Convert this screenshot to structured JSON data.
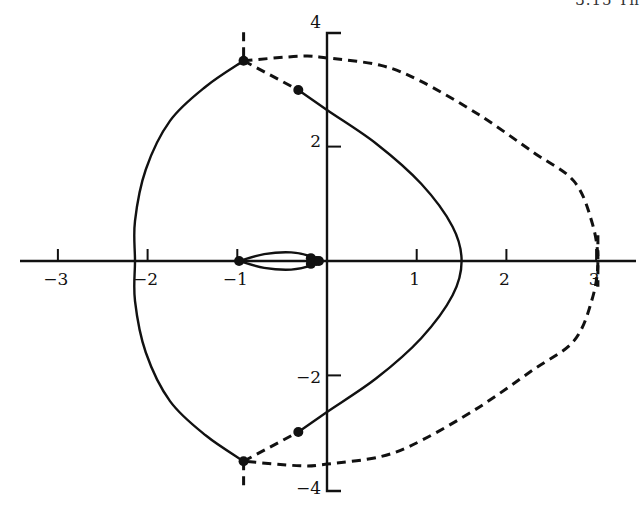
{
  "page": {
    "header_fragment": "3.15  Th"
  },
  "chart_data": {
    "type": "line",
    "title": "",
    "xlabel": "",
    "ylabel": "",
    "xlim": [
      -3.3,
      3.4
    ],
    "ylim": [
      -4,
      4
    ],
    "grid": false,
    "legend": null,
    "x_ticks": [
      -3,
      -2,
      -1,
      1,
      2,
      3
    ],
    "x_tick_labels": [
      "−3",
      "−2",
      "−1",
      "1",
      "2",
      "3"
    ],
    "y_ticks": [
      4,
      2,
      -2,
      -4
    ],
    "y_tick_labels": [
      "4",
      "2",
      "−2",
      "−4"
    ],
    "series": [
      {
        "name": "solid-outer-locus",
        "style": "solid",
        "points": [
          [
            -0.93,
            3.5
          ],
          [
            -1.35,
            3.05
          ],
          [
            -1.75,
            2.45
          ],
          [
            -2.02,
            1.6
          ],
          [
            -2.14,
            0.7
          ],
          [
            -2.14,
            0.0
          ],
          [
            -2.14,
            -0.7
          ],
          [
            -2.02,
            -1.6
          ],
          [
            -1.75,
            -2.45
          ],
          [
            -1.35,
            -3.05
          ],
          [
            -0.93,
            -3.5
          ]
        ]
      },
      {
        "name": "solid-inner-locus",
        "style": "solid",
        "points": [
          [
            -0.32,
            2.99
          ],
          [
            0.0,
            2.64
          ],
          [
            0.55,
            2.05
          ],
          [
            1.05,
            1.35
          ],
          [
            1.4,
            0.6
          ],
          [
            1.5,
            0.0
          ],
          [
            1.4,
            -0.6
          ],
          [
            1.05,
            -1.35
          ],
          [
            0.55,
            -2.05
          ],
          [
            0.0,
            -2.64
          ],
          [
            -0.32,
            -2.99
          ]
        ]
      },
      {
        "name": "dashed-outer-locus",
        "style": "dashed",
        "points": [
          [
            -0.93,
            3.5
          ],
          [
            -0.3,
            3.58
          ],
          [
            0.0,
            3.55
          ],
          [
            0.6,
            3.42
          ],
          [
            1.05,
            3.14
          ],
          [
            1.7,
            2.55
          ],
          [
            2.3,
            1.9
          ],
          [
            2.75,
            1.4
          ],
          [
            2.95,
            0.7
          ],
          [
            3.02,
            0.0
          ],
          [
            2.95,
            -0.7
          ],
          [
            2.75,
            -1.4
          ],
          [
            2.3,
            -1.9
          ],
          [
            1.7,
            -2.55
          ],
          [
            1.05,
            -3.14
          ],
          [
            0.6,
            -3.42
          ],
          [
            0.0,
            -3.55
          ],
          [
            -0.3,
            -3.58
          ],
          [
            -0.93,
            -3.5
          ]
        ]
      },
      {
        "name": "dashed-inner-connector",
        "style": "dashed",
        "points": [
          [
            -0.93,
            3.5
          ],
          [
            -0.32,
            2.99
          ]
        ]
      },
      {
        "name": "dashed-inner-connector-lower",
        "style": "dashed",
        "points": [
          [
            -0.93,
            -3.5
          ],
          [
            -0.32,
            -2.99
          ]
        ]
      },
      {
        "name": "dashed-vertical-stubs",
        "style": "dashed",
        "points": [
          [
            -0.93,
            4.0
          ],
          [
            -0.93,
            3.5
          ],
          null,
          [
            -0.93,
            -3.5
          ],
          [
            -0.93,
            -4.0
          ],
          null,
          [
            3.02,
            0.45
          ],
          [
            3.02,
            -0.45
          ]
        ]
      },
      {
        "name": "small-lobe",
        "style": "solid",
        "points": [
          [
            -0.98,
            0.0
          ],
          [
            -0.7,
            0.12
          ],
          [
            -0.4,
            0.15
          ],
          [
            -0.18,
            0.08
          ],
          [
            -0.12,
            0.0
          ],
          [
            -0.18,
            -0.08
          ],
          [
            -0.4,
            -0.15
          ],
          [
            -0.7,
            -0.12
          ],
          [
            -0.98,
            0.0
          ]
        ]
      }
    ],
    "markers": [
      [
        -0.93,
        3.5
      ],
      [
        -0.32,
        2.99
      ],
      [
        -0.93,
        -3.5
      ],
      [
        -0.32,
        -2.99
      ],
      [
        -0.98,
        0.0
      ],
      [
        -0.18,
        0.05
      ],
      [
        -0.18,
        -0.05
      ],
      [
        -0.12,
        0.0
      ],
      [
        -0.09,
        0.0
      ]
    ]
  }
}
